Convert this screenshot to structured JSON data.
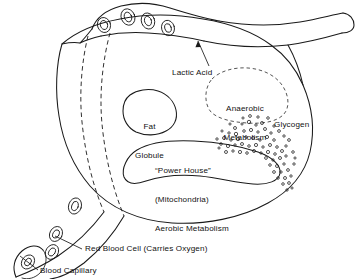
{
  "figure": {
    "colors": {
      "ink": "#1a1a1a",
      "background": "#ffffff"
    }
  },
  "labels": {
    "lactic_acid": "Lactic Acid",
    "anaerobic_metabolism_line1": "Anaerobic",
    "anaerobic_metabolism_line2": "Metabolism",
    "glycogen": "Glycogen",
    "fat_globule_line1": "Fat",
    "fat_globule_line2": "Globule",
    "power_house_line1": "“Power House”",
    "power_house_line2": "(Mitochondria)",
    "power_house_line3": "Aerobic Metabolism",
    "red_blood_cell": "Red Blood Cell (Carries Oxygen)",
    "blood_capillary": "Blood Capillary"
  },
  "structures": {
    "muscle_cell": "muscle-cell-outline",
    "capillary": "blood-capillary-vessel",
    "red_blood_cells_count": 8,
    "glycogen_granule_count": 84,
    "lactic_acid_arrow": "arrow-pointing-to-capillary"
  }
}
